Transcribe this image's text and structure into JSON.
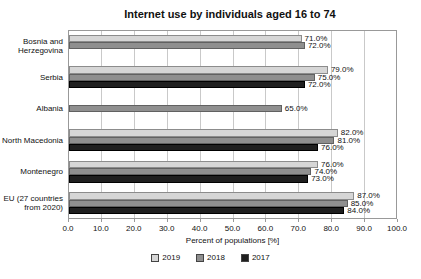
{
  "chart_data": {
    "type": "bar",
    "orientation": "horizontal",
    "title": "Internet use by individuals aged 16 to 74",
    "xlabel": "Percent of populations [%]",
    "xlim": [
      0,
      100
    ],
    "xtick_step": 10,
    "grid": true,
    "legend_position": "bottom",
    "categories": [
      "Bosnia and\nHerzegovina",
      "Serbia",
      "Albania",
      "North Macedonia",
      "Montenegro",
      "EU (27 countries\nfrom 2020)"
    ],
    "series": [
      {
        "name": "2019",
        "color": "#d6d6d6",
        "border": "#8c8c8c",
        "values": [
          71.0,
          79.0,
          null,
          82.0,
          76.0,
          87.0
        ]
      },
      {
        "name": "2018",
        "color": "#8f8f8f",
        "border": "#616161",
        "values": [
          72.0,
          75.0,
          65.0,
          81.0,
          74.0,
          85.0
        ]
      },
      {
        "name": "2017",
        "color": "#1f1f1f",
        "border": "#000000",
        "values": [
          null,
          72.0,
          null,
          76.0,
          73.0,
          84.0
        ]
      }
    ],
    "value_label_suffix": "%"
  },
  "colors": {
    "grid": "#c9c9c9",
    "plot_border": "#999999",
    "background": "#ffffff",
    "text": "#111111"
  }
}
